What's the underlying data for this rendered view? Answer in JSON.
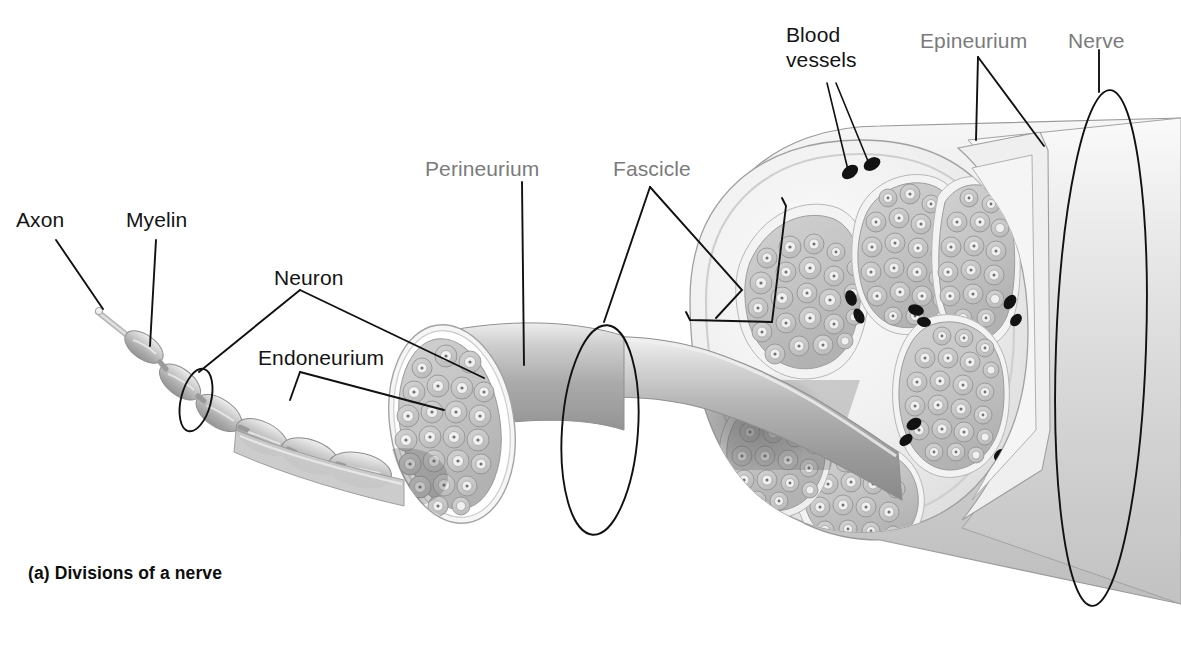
{
  "figure": {
    "caption": "(a) Divisions of a nerve",
    "background_color": "#ffffff",
    "label_dark_color": "#141414",
    "label_gray_color": "#7b7b7b"
  },
  "labels": {
    "axon": "Axon",
    "myelin": "Myelin",
    "neuron": "Neuron",
    "endoneurium": "Endoneurium",
    "perineurium": "Perineurium",
    "fascicle": "Fascicle",
    "blood_vessels_line1": "Blood",
    "blood_vessels_line2": "vessels",
    "epineurium": "Epineurium",
    "nerve": "Nerve"
  },
  "structures": {
    "nerve_sheath": "epineurium-sheath",
    "trunk": "nerve-trunk",
    "single_fascicle": "single-fascicle-tube",
    "myelinated_axon": "myelinated-axon",
    "cross_section": "nerve-cross-section",
    "fascicle_count": 6,
    "blood_vessel_count": 11
  },
  "colors": {
    "tissue_light": "#e9e9e9",
    "tissue_mid": "#c9c9c9",
    "tissue_dark": "#a6a6a6",
    "outline": "#8c8c8c",
    "leader": "#111111",
    "vessel": "#121212"
  }
}
